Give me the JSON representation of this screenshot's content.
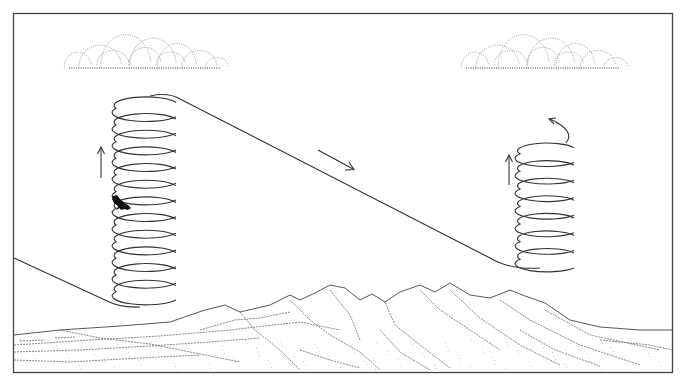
{
  "figure": {
    "frame": {
      "x": 13,
      "y": 13,
      "width": 659,
      "height": 359,
      "stroke": "#444444"
    },
    "colors": {
      "ink": "#333333",
      "cloud": "#9a9a9a",
      "terrain": "#555555",
      "background": "#ffffff"
    },
    "clouds": [
      {
        "name": "left-cloud",
        "cx": 145,
        "baseY": 68,
        "width": 160
      },
      {
        "name": "right-cloud",
        "cx": 543,
        "baseY": 68,
        "width": 162
      }
    ],
    "thermals": [
      {
        "name": "left-thermal-spiral",
        "cx": 146,
        "rx": 30,
        "ry": 8,
        "topY": 100,
        "bottomY": 300,
        "coils": 12
      },
      {
        "name": "right-thermal-spiral",
        "cx": 547,
        "rx": 27,
        "ry": 7,
        "topY": 145,
        "bottomY": 268,
        "coils": 7
      }
    ],
    "arrows": [
      {
        "name": "climb-arrow-left",
        "direction": "up",
        "x": 101,
        "y1": 178,
        "y2": 148
      },
      {
        "name": "glide-arrow",
        "direction": "down-right",
        "x1": 318,
        "y1": 151,
        "x2": 353,
        "y2": 170
      },
      {
        "name": "climb-arrow-right",
        "direction": "up",
        "x": 509,
        "y1": 185,
        "y2": 156
      }
    ],
    "bird": {
      "name": "soaring-bird",
      "x": 120,
      "y": 205
    },
    "labels": {
      "caption": ""
    }
  }
}
